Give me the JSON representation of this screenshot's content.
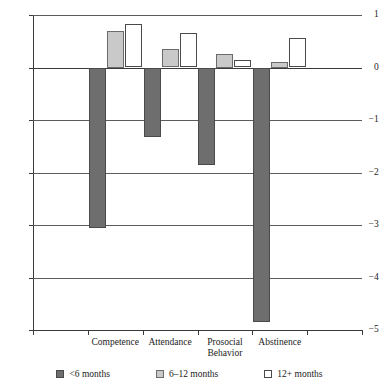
{
  "chart_data": {
    "type": "bar",
    "title": "",
    "subtitle": "",
    "xlabel": "",
    "ylabel": "",
    "categories": [
      "Competence",
      "Attendance",
      "Prosocial Behavior",
      "Abstinence"
    ],
    "series": [
      {
        "name": "<6 months",
        "values": [
          -3.05,
          -1.32,
          -1.86,
          -4.85
        ],
        "color": "#6e6e6e"
      },
      {
        "name": "6–12 months",
        "values": [
          0.7,
          0.36,
          0.25,
          0.1
        ],
        "color": "#c9c9c9"
      },
      {
        "name": "12+ months",
        "values": [
          0.83,
          0.66,
          0.14,
          0.57
        ],
        "color": "#ffffff"
      }
    ],
    "ylim": [
      -5,
      1
    ],
    "yticks": [
      1,
      0,
      -1,
      -2,
      -3,
      -4,
      -5
    ],
    "ytick_labels": [
      "1",
      "0",
      "−1",
      "−2",
      "−3",
      "−4",
      "−5"
    ],
    "grid": true,
    "legend_position": "bottom"
  },
  "legend": {
    "items": [
      {
        "label": "<6 months"
      },
      {
        "label": "6–12 months"
      },
      {
        "label": "12+ months"
      }
    ]
  }
}
